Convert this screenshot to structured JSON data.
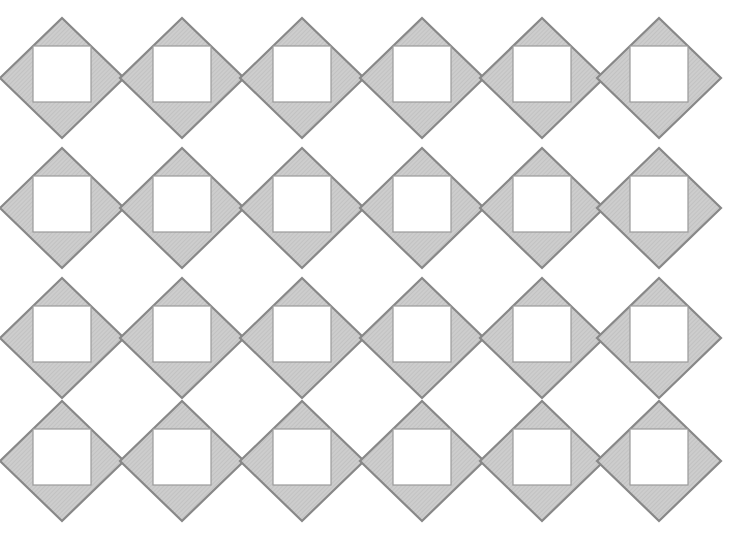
{
  "figure": {
    "type": "geometric-tiling-diagram",
    "canvas": {
      "width": 741,
      "height": 537,
      "background_color": "#ffffff"
    },
    "element_names": {
      "diamond": "diamond-tile",
      "inner_square": "inner-white-square",
      "lattice": "diamond-lattice-grid"
    }
  },
  "style": {
    "diamond_fill": "#cdcdcd",
    "diamond_stroke": "#888888",
    "diamond_stroke_width": 2.2,
    "inner_square_fill": "#ffffff",
    "inner_square_stroke": "#9a9a9a",
    "inner_square_stroke_width": 1.2,
    "hatch_color": "#b8b8b8",
    "hatch_opacity": 0.45,
    "hatch_spacing": 3
  },
  "geometry": {
    "columns": 6,
    "rows": 4,
    "column_spacing": 120,
    "row_spacing": 130,
    "first_center_x": 62,
    "first_center_y": 78,
    "diamond_half_width": 62,
    "diamond_half_height": 60,
    "inner_square_width": 58,
    "inner_square_height": 56,
    "inner_square_offset_y": -4
  },
  "tiles": [
    {
      "row": 0,
      "col": 0,
      "cx": 62,
      "cy": 78
    },
    {
      "row": 0,
      "col": 1,
      "cx": 182,
      "cy": 78
    },
    {
      "row": 0,
      "col": 2,
      "cx": 302,
      "cy": 78
    },
    {
      "row": 0,
      "col": 3,
      "cx": 422,
      "cy": 78
    },
    {
      "row": 0,
      "col": 4,
      "cx": 542,
      "cy": 78
    },
    {
      "row": 0,
      "col": 5,
      "cx": 659,
      "cy": 78
    },
    {
      "row": 1,
      "col": 0,
      "cx": 62,
      "cy": 208
    },
    {
      "row": 1,
      "col": 1,
      "cx": 182,
      "cy": 208
    },
    {
      "row": 1,
      "col": 2,
      "cx": 302,
      "cy": 208
    },
    {
      "row": 1,
      "col": 3,
      "cx": 422,
      "cy": 208
    },
    {
      "row": 1,
      "col": 4,
      "cx": 542,
      "cy": 208
    },
    {
      "row": 1,
      "col": 5,
      "cx": 659,
      "cy": 208
    },
    {
      "row": 2,
      "col": 0,
      "cx": 62,
      "cy": 338
    },
    {
      "row": 2,
      "col": 1,
      "cx": 182,
      "cy": 338
    },
    {
      "row": 2,
      "col": 2,
      "cx": 302,
      "cy": 338
    },
    {
      "row": 2,
      "col": 3,
      "cx": 422,
      "cy": 338
    },
    {
      "row": 2,
      "col": 4,
      "cx": 542,
      "cy": 338
    },
    {
      "row": 2,
      "col": 5,
      "cx": 659,
      "cy": 338
    },
    {
      "row": 3,
      "col": 0,
      "cx": 62,
      "cy": 461
    },
    {
      "row": 3,
      "col": 1,
      "cx": 182,
      "cy": 461
    },
    {
      "row": 3,
      "col": 2,
      "cx": 302,
      "cy": 461
    },
    {
      "row": 3,
      "col": 3,
      "cx": 422,
      "cy": 461
    },
    {
      "row": 3,
      "col": 4,
      "cx": 542,
      "cy": 461
    },
    {
      "row": 3,
      "col": 5,
      "cx": 659,
      "cy": 461
    }
  ],
  "labels": {
    "none_visible": ""
  }
}
